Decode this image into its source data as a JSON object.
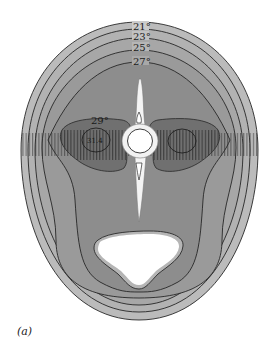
{
  "figure": {
    "panel_label": "(a)",
    "isotherms": [
      {
        "label": "21°",
        "value": 21
      },
      {
        "label": "23°",
        "value": 23
      },
      {
        "label": "25°",
        "value": 25
      },
      {
        "label": "27°",
        "value": 27
      },
      {
        "label": "29°",
        "value": 29
      },
      {
        "label": "31.4",
        "value": 31.4
      }
    ],
    "colors": {
      "band_outer": "#cbcbcb",
      "band_2": "#bdbdbd",
      "band_3": "#adadad",
      "band_4": "#9e9e9e",
      "band_inner": "#919191",
      "lobe": "#6e6e6e",
      "core": "#5c5c5c",
      "contour": "#2a2a2a",
      "bone": "#f4f4f4",
      "cavity": "#ffffff"
    }
  }
}
